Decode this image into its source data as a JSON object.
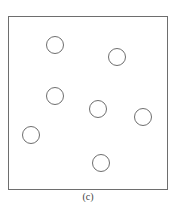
{
  "figure": {
    "caption": "(c)",
    "stroke_color": "#6e6e6e",
    "background": "#ffffff",
    "circle_count": 7,
    "circles": [
      {
        "id": 1,
        "cx": 55,
        "cy": 45
      },
      {
        "id": 2,
        "cx": 117,
        "cy": 57
      },
      {
        "id": 3,
        "cx": 55,
        "cy": 96
      },
      {
        "id": 4,
        "cx": 98,
        "cy": 109
      },
      {
        "id": 5,
        "cx": 143,
        "cy": 117
      },
      {
        "id": 6,
        "cx": 31,
        "cy": 135
      },
      {
        "id": 7,
        "cx": 101,
        "cy": 163
      }
    ]
  }
}
